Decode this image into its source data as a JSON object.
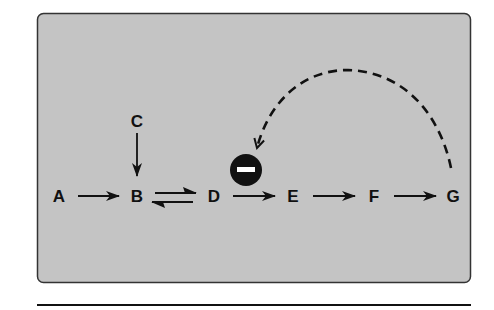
{
  "diagram": {
    "panel": {
      "fill": "#c4c4c4",
      "stroke": "#333333"
    },
    "nodes": [
      {
        "id": "A",
        "label": "A",
        "x": 59,
        "y": 196
      },
      {
        "id": "B",
        "label": "B",
        "x": 137,
        "y": 196
      },
      {
        "id": "C",
        "label": "C",
        "x": 137,
        "y": 121
      },
      {
        "id": "D",
        "label": "D",
        "x": 214,
        "y": 196
      },
      {
        "id": "E",
        "label": "E",
        "x": 293,
        "y": 196
      },
      {
        "id": "F",
        "label": "F",
        "x": 374,
        "y": 196
      },
      {
        "id": "G",
        "label": "G",
        "x": 453,
        "y": 196
      }
    ],
    "edges": [
      {
        "from": "A",
        "to": "B",
        "type": "arrow"
      },
      {
        "from": "C",
        "to": "B",
        "type": "arrow"
      },
      {
        "from": "B",
        "to": "D",
        "type": "reversible"
      },
      {
        "from": "D",
        "to": "E",
        "type": "arrow"
      },
      {
        "from": "E",
        "to": "F",
        "type": "arrow"
      },
      {
        "from": "F",
        "to": "G",
        "type": "arrow"
      },
      {
        "from": "G",
        "to": "D-E step",
        "type": "dashed-feedback-inhibition"
      }
    ],
    "inhibition_symbol": {
      "icon": "minus-circle-icon",
      "sign": "−",
      "fill": "#111111"
    }
  }
}
